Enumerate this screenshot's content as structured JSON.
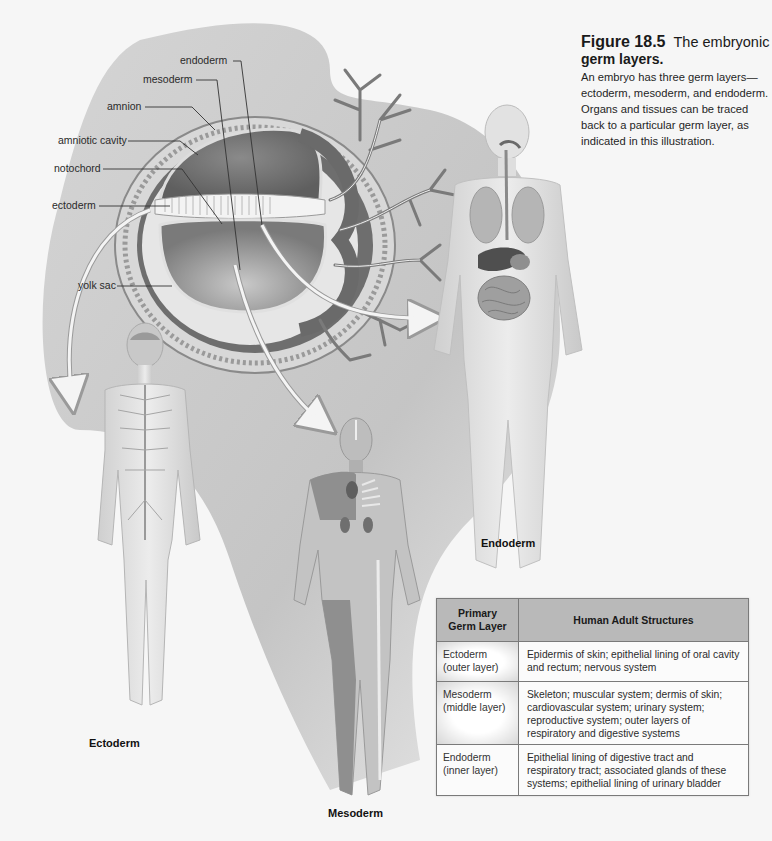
{
  "figure": {
    "number": "Figure 18.5",
    "title": "The embryonic germ layers.",
    "title_line1": "The embryonic",
    "title_line2": "germ layers.",
    "body": [
      "An embryo has three germ layers—",
      "ectoderm, mesoderm, and endoderm.",
      "Organs and tissues can be traced",
      "back to a particular germ layer, as",
      "indicated in this illustration."
    ]
  },
  "embryo_labels": {
    "endoderm": "endoderm",
    "mesoderm": "mesoderm",
    "amnion": "amnion",
    "amniotic_cavity": "amniotic cavity",
    "notochord": "notochord",
    "ectoderm": "ectoderm",
    "yolk_sac": "yolk sac"
  },
  "body_figures": {
    "ectoderm": "Ectoderm",
    "mesoderm": "Mesoderm",
    "endoderm": "Endoderm"
  },
  "table": {
    "headers": [
      "Primary Germ Layer",
      "Human Adult Structures"
    ],
    "header_col1_line1": "Primary",
    "header_col1_line2": "Germ Layer",
    "rows": [
      {
        "layer": "Ectoderm",
        "position": "(outer layer)",
        "structures": "Epidermis of skin; epithelial lining of oral cavity and rectum; nervous system"
      },
      {
        "layer": "Mesoderm",
        "position": "(middle layer)",
        "structures": "Skeleton; muscular system; dermis of skin; cardiovascular system; urinary system; reproductive system; outer layers of respiratory and digestive systems"
      },
      {
        "layer": "Endoderm",
        "position": "(inner layer)",
        "structures": "Epithelial lining of digestive tract and respiratory tract; associated glands of these systems; epithelial lining of urinary bladder"
      }
    ]
  },
  "colors": {
    "background": "#f6f6f6",
    "swoosh": "#c4c4c4",
    "table_header": "#b9b9b9",
    "table_border": "#7a7a7a"
  }
}
